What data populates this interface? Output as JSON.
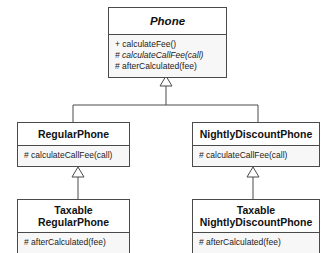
{
  "diagram": {
    "type": "uml-class-diagram",
    "background_color": "#ffffff",
    "border_color": "#4a4a4a",
    "header_fill": "#ffffff",
    "operations_fill": "#f7f7f7",
    "text_color": "#111111",
    "relationship_type": "generalization",
    "arrow_style": "hollow-triangle"
  },
  "classes": {
    "phone": {
      "name": "Phone",
      "is_abstract": true,
      "operations": [
        {
          "visibility": "+",
          "signature": "calculateFee()",
          "is_abstract": false
        },
        {
          "visibility": "#",
          "signature": "calculateCallFee(call)",
          "is_abstract": true
        },
        {
          "visibility": "#",
          "signature": "afterCalculated(fee)",
          "is_abstract": false
        }
      ]
    },
    "regular_phone": {
      "name": "RegularPhone",
      "is_abstract": false,
      "operations": [
        {
          "visibility": "#",
          "signature": "calculateCallFee(call)",
          "is_abstract": false
        }
      ]
    },
    "nightly_discount_phone": {
      "name": "NightlyDiscountPhone",
      "is_abstract": false,
      "operations": [
        {
          "visibility": "#",
          "signature": "calculateCallFee(call)",
          "is_abstract": false
        }
      ]
    },
    "taxable_regular_phone": {
      "name_line1": "Taxable",
      "name_line2": "RegularPhone",
      "is_abstract": false,
      "operations": [
        {
          "visibility": "#",
          "signature": "afterCalculated(fee)",
          "is_abstract": false
        }
      ]
    },
    "taxable_nightly_discount_phone": {
      "name_line1": "Taxable",
      "name_line2": "NightlyDiscountPhone",
      "is_abstract": false,
      "operations": [
        {
          "visibility": "#",
          "signature": "afterCalculated(fee)",
          "is_abstract": false
        }
      ]
    }
  },
  "relationships": [
    {
      "from": "RegularPhone",
      "to": "Phone",
      "type": "generalization"
    },
    {
      "from": "NightlyDiscountPhone",
      "to": "Phone",
      "type": "generalization"
    },
    {
      "from": "Taxable RegularPhone",
      "to": "RegularPhone",
      "type": "generalization"
    },
    {
      "from": "Taxable NightlyDiscountPhone",
      "to": "NightlyDiscountPhone",
      "type": "generalization"
    }
  ]
}
